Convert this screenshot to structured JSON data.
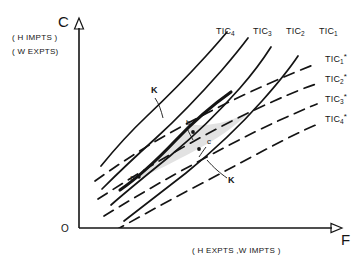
{
  "figure": {
    "background_color": "#ffffff",
    "ink_color": "#141414",
    "shade_color": "#e2e2e2"
  },
  "axes": {
    "y_axis": {
      "letter": "C",
      "name": "vertical-axis",
      "caption_line_1": "( H IMPTS )",
      "caption_line_2": "( W EXPTS)"
    },
    "x_axis": {
      "letter": "F",
      "name": "horizontal-axis",
      "caption": "( H EXPTS ,W IMPTS )"
    },
    "origin": {
      "letter": "O"
    }
  },
  "curves": {
    "home_label_prefix": "TIC",
    "home": [
      {
        "label": "TIC",
        "sub": "4",
        "sup": "",
        "style": "solid"
      },
      {
        "label": "TIC",
        "sub": "3",
        "sup": "",
        "style": "solid"
      },
      {
        "label": "TIC",
        "sub": "2",
        "sup": "",
        "style": "solid"
      },
      {
        "label": "TIC",
        "sub": "1",
        "sup": "",
        "style": "solid"
      }
    ],
    "foreign": [
      {
        "label": "TIC",
        "sub": "1",
        "sup": "*",
        "style": "dashed"
      },
      {
        "label": "TIC",
        "sub": "2",
        "sup": "*",
        "style": "dashed"
      },
      {
        "label": "TIC",
        "sub": "3",
        "sup": "*",
        "style": "dashed"
      },
      {
        "label": "TIC",
        "sub": "4",
        "sup": "*",
        "style": "dashed"
      }
    ]
  },
  "contract_curve": {
    "name": "contract-curve-KK",
    "end_label_top": "K",
    "end_label_bottom": "K"
  },
  "points": [
    {
      "id": "a",
      "label": "a"
    },
    {
      "id": "b",
      "label": "b"
    },
    {
      "id": "c",
      "label": "c"
    }
  ]
}
